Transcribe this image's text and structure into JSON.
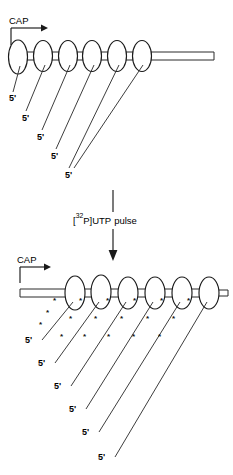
{
  "figure": {
    "background_color": "#ffffff",
    "ink_color": "#1a1a1a",
    "width": 233,
    "height": 475
  },
  "panels": [
    {
      "id": "panel-before",
      "name": "before-pulse",
      "cap_label": "CAP",
      "nucleosome_count": 6,
      "nucleosomes": [
        {
          "cx": 18,
          "cy": 57,
          "rx": 9.5,
          "ry": 17
        },
        {
          "cx": 43,
          "cy": 56,
          "rx": 9.5,
          "ry": 15.5
        },
        {
          "cx": 68,
          "cy": 56,
          "rx": 9.5,
          "ry": 15.5
        },
        {
          "cx": 92,
          "cy": 56,
          "rx": 9.5,
          "ry": 15.5
        },
        {
          "cx": 117,
          "cy": 56,
          "rx": 9.5,
          "ry": 15.5
        },
        {
          "cx": 142,
          "cy": 56,
          "rx": 9.5,
          "ry": 15.5
        }
      ],
      "dna_tail": {
        "x1": 150,
        "x2": 214,
        "y_top": 52,
        "y_bottom": 60
      },
      "transcripts": [
        {
          "from_x": 18,
          "from_y": 66,
          "to_x": 11,
          "to_y": 90,
          "label": "5'",
          "label_x": 9,
          "label_y": 101
        },
        {
          "from_x": 43,
          "from_y": 66,
          "to_x": 27,
          "to_y": 110,
          "label": "5'",
          "label_x": 22,
          "label_y": 121
        },
        {
          "from_x": 68,
          "from_y": 66,
          "to_x": 44,
          "to_y": 129,
          "label": "5'",
          "label_x": 36,
          "label_y": 139
        },
        {
          "from_x": 92,
          "from_y": 66,
          "to_x": 58,
          "to_y": 148,
          "label": "5'",
          "label_x": 50,
          "label_y": 158
        },
        {
          "from_x": 117,
          "from_y": 66,
          "to_x": 70,
          "to_y": 166,
          "label": "5'",
          "label_x": 63,
          "label_y": 176
        },
        {
          "from_x": 142,
          "from_y": 66,
          "to_x": 76,
          "to_y": 166,
          "label": "5'",
          "label_x": 63,
          "label_y": 176
        }
      ],
      "labels_5prime": [
        "5'",
        "5'",
        "5'",
        "5'",
        "5'",
        "5'"
      ]
    },
    {
      "id": "panel-after",
      "name": "after-pulse",
      "cap_label": "CAP",
      "nucleosome_count": 6,
      "nucleosomes": [
        {
          "cx": 75,
          "cy": 293,
          "rx": 10,
          "ry": 17
        },
        {
          "cx": 101,
          "cy": 292,
          "rx": 10,
          "ry": 17
        },
        {
          "cx": 128,
          "cy": 293,
          "rx": 10,
          "ry": 16
        },
        {
          "cx": 155,
          "cy": 293,
          "rx": 10,
          "ry": 16
        },
        {
          "cx": 182,
          "cy": 293,
          "rx": 10,
          "ry": 16
        },
        {
          "cx": 209,
          "cy": 293,
          "rx": 10,
          "ry": 16
        }
      ],
      "dna_lead": {
        "x1": 22,
        "x2": 66,
        "y_top": 289,
        "y_bottom": 297
      },
      "dna_stub": {
        "x1": 218,
        "x2": 228,
        "y_top": 290,
        "y_bottom": 296
      },
      "transcripts": [
        {
          "label": "5'",
          "label_x": 33,
          "label_y": 340
        },
        {
          "label": "5'",
          "label_x": 45,
          "label_y": 363
        },
        {
          "label": "5'",
          "label_x": 61,
          "label_y": 386
        },
        {
          "label": "5'",
          "label_x": 76,
          "label_y": 408
        },
        {
          "label": "5'",
          "label_x": 88,
          "label_y": 432
        },
        {
          "label": "5'",
          "label_x": 104,
          "label_y": 456
        }
      ],
      "labels_5prime": [
        "5'",
        "5'",
        "5'",
        "5'",
        "5'",
        "5'"
      ],
      "radiolabel_glyph": "*",
      "radiolabel_count_per_transcript": 3
    }
  ],
  "arrow": {
    "name": "pulse-arrow",
    "label_text_parts": {
      "open_bracket": "[",
      "superscript": "32",
      "isotope": "P",
      "close_bracket": "]",
      "nucleotide": "UTP",
      "word": "pulse"
    },
    "label_full": "[32P]UTP pulse",
    "shaft_x": 113,
    "shaft_y_top": 190,
    "shaft_y_bottom": 258,
    "gap_y_top": 212,
    "gap_y_bottom": 228
  }
}
